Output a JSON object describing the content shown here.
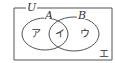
{
  "diagram": {
    "type": "venn",
    "universe_label": "U",
    "sets": [
      {
        "label": "A"
      },
      {
        "label": "B"
      }
    ],
    "regions": [
      {
        "id": "A-only",
        "label": "ア"
      },
      {
        "id": "A-and-B",
        "label": "イ"
      },
      {
        "id": "B-only",
        "label": "ウ"
      },
      {
        "id": "outside",
        "label": "エ"
      }
    ],
    "colors": {
      "line": "#555555",
      "text": "#333333",
      "background": "#ffffff"
    }
  }
}
